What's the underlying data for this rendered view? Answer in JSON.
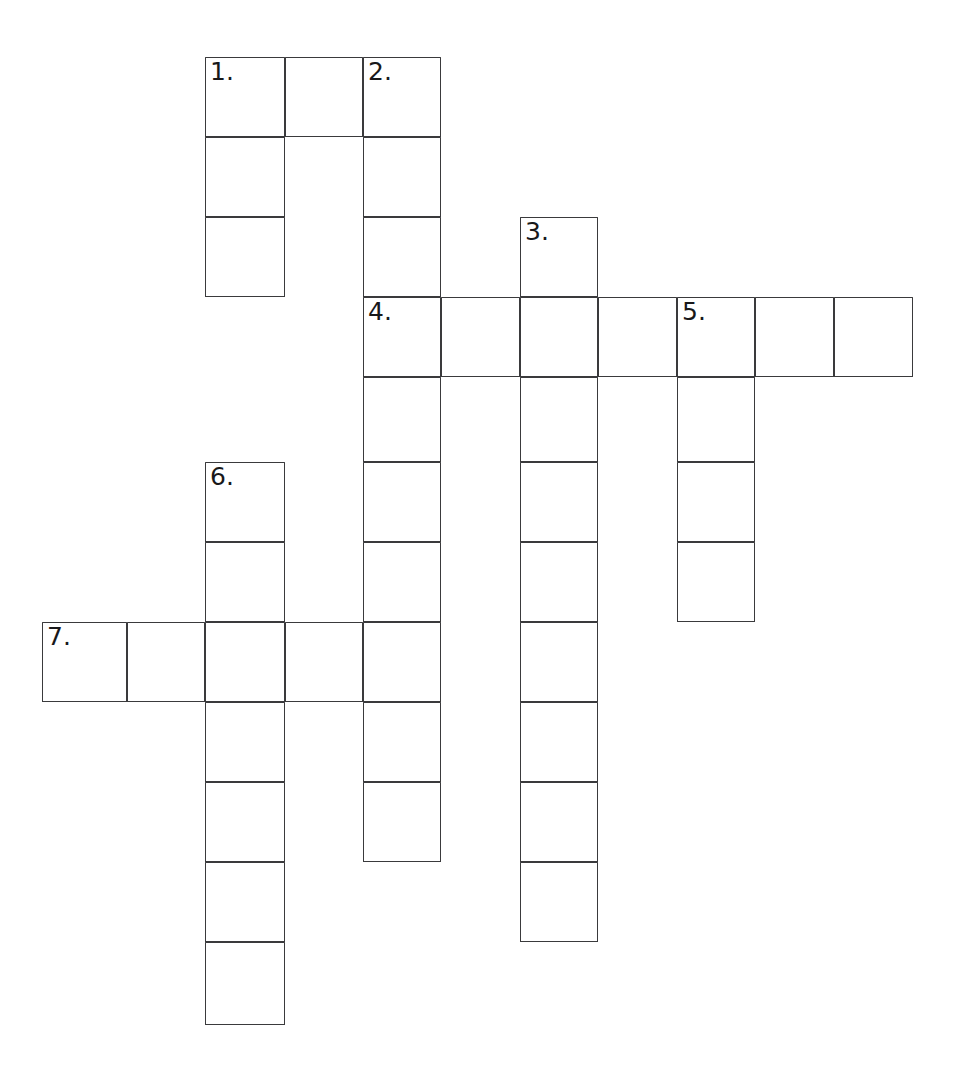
{
  "document": {
    "type": "crossword-puzzle-grid",
    "title": "Crossword Puzzle Grid",
    "background_color": "#ffffff",
    "ink_color": "#3a3a3c",
    "number_color": "#18181a"
  },
  "grid": {
    "cell_size": 78.5,
    "origin_x": 42,
    "origin_y": 57,
    "line_width": 1.6,
    "column_count": 11,
    "row_count": 13,
    "column_x": [
      42,
      127,
      205,
      285,
      363,
      441,
      520,
      598,
      677,
      755,
      834
    ],
    "row_y": [
      57,
      137,
      217,
      297,
      377,
      462,
      542,
      622,
      702,
      782,
      862,
      942,
      1025
    ],
    "total_filled_cells": 45
  },
  "clue_numbers": {
    "1": "1.",
    "2": "2.",
    "3": "3.",
    "4": "4.",
    "5": "5.",
    "6": "6.",
    "7": "7."
  },
  "entries": [
    {
      "number": "1.",
      "label": "1 Down",
      "direction": "down",
      "length": 3,
      "start_col": 2,
      "start_row": 0,
      "answer": ""
    },
    {
      "number": "2.",
      "label": "2 Down",
      "direction": "down",
      "length": 10,
      "start_col": 4,
      "start_row": 0,
      "answer": ""
    },
    {
      "number": "3.",
      "label": "3 Down",
      "direction": "down",
      "length": 9,
      "start_col": 6,
      "start_row": 2,
      "answer": ""
    },
    {
      "number": "4.",
      "label": "4 Across",
      "direction": "across",
      "length": 7,
      "start_col": 4,
      "start_row": 3,
      "answer": ""
    },
    {
      "number": "5.",
      "label": "5 Down",
      "direction": "down",
      "length": 4,
      "start_col": 8,
      "start_row": 3,
      "answer": ""
    },
    {
      "number": "6.",
      "label": "6 Down",
      "direction": "down",
      "length": 7,
      "start_col": 2,
      "start_row": 5,
      "answer": ""
    },
    {
      "number": "7.",
      "label": "7 Across",
      "direction": "across",
      "length": 5,
      "start_col": 0,
      "start_row": 7,
      "answer": ""
    }
  ],
  "cells": [
    {
      "col": 2,
      "row": 0,
      "number": "1.",
      "letter": ""
    },
    {
      "col": 3,
      "row": 0,
      "number": "",
      "letter": ""
    },
    {
      "col": 4,
      "row": 0,
      "number": "2.",
      "letter": ""
    },
    {
      "col": 2,
      "row": 1,
      "number": "",
      "letter": ""
    },
    {
      "col": 4,
      "row": 1,
      "number": "",
      "letter": ""
    },
    {
      "col": 2,
      "row": 2,
      "number": "",
      "letter": ""
    },
    {
      "col": 4,
      "row": 2,
      "number": "",
      "letter": ""
    },
    {
      "col": 6,
      "row": 2,
      "number": "3.",
      "letter": ""
    },
    {
      "col": 4,
      "row": 3,
      "number": "4.",
      "letter": ""
    },
    {
      "col": 5,
      "row": 3,
      "number": "",
      "letter": ""
    },
    {
      "col": 6,
      "row": 3,
      "number": "",
      "letter": ""
    },
    {
      "col": 7,
      "row": 3,
      "number": "",
      "letter": ""
    },
    {
      "col": 8,
      "row": 3,
      "number": "5.",
      "letter": ""
    },
    {
      "col": 9,
      "row": 3,
      "number": "",
      "letter": ""
    },
    {
      "col": 10,
      "row": 3,
      "number": "",
      "letter": ""
    },
    {
      "col": 4,
      "row": 4,
      "number": "",
      "letter": ""
    },
    {
      "col": 6,
      "row": 4,
      "number": "",
      "letter": ""
    },
    {
      "col": 8,
      "row": 4,
      "number": "",
      "letter": ""
    },
    {
      "col": 2,
      "row": 5,
      "number": "6.",
      "letter": ""
    },
    {
      "col": 4,
      "row": 5,
      "number": "",
      "letter": ""
    },
    {
      "col": 6,
      "row": 5,
      "number": "",
      "letter": ""
    },
    {
      "col": 8,
      "row": 5,
      "number": "",
      "letter": ""
    },
    {
      "col": 2,
      "row": 6,
      "number": "",
      "letter": ""
    },
    {
      "col": 4,
      "row": 6,
      "number": "",
      "letter": ""
    },
    {
      "col": 6,
      "row": 6,
      "number": "",
      "letter": ""
    },
    {
      "col": 8,
      "row": 6,
      "number": "",
      "letter": ""
    },
    {
      "col": 0,
      "row": 7,
      "number": "7.",
      "letter": ""
    },
    {
      "col": 1,
      "row": 7,
      "number": "",
      "letter": ""
    },
    {
      "col": 2,
      "row": 7,
      "number": "",
      "letter": ""
    },
    {
      "col": 3,
      "row": 7,
      "number": "",
      "letter": ""
    },
    {
      "col": 4,
      "row": 7,
      "number": "",
      "letter": ""
    },
    {
      "col": 6,
      "row": 7,
      "number": "",
      "letter": ""
    },
    {
      "col": 2,
      "row": 8,
      "number": "",
      "letter": ""
    },
    {
      "col": 4,
      "row": 8,
      "number": "",
      "letter": ""
    },
    {
      "col": 6,
      "row": 8,
      "number": "",
      "letter": ""
    },
    {
      "col": 2,
      "row": 9,
      "number": "",
      "letter": ""
    },
    {
      "col": 4,
      "row": 9,
      "number": "",
      "letter": ""
    },
    {
      "col": 6,
      "row": 9,
      "number": "",
      "letter": ""
    },
    {
      "col": 2,
      "row": 10,
      "number": "",
      "letter": ""
    },
    {
      "col": 6,
      "row": 10,
      "number": "",
      "letter": ""
    },
    {
      "col": 2,
      "row": 11,
      "number": "",
      "letter": ""
    }
  ]
}
